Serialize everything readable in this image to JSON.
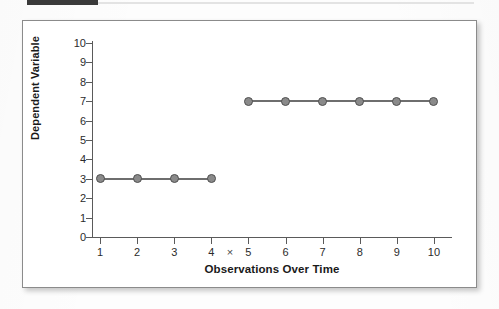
{
  "header": {
    "bar_color": "#3a3a3a",
    "rule_color": "#e3e3e3"
  },
  "figure": {
    "frame_color": "#8b8b8b",
    "background": "#ffffff"
  },
  "chart_data": {
    "type": "line",
    "title": "",
    "subtitle": "",
    "xlabel": "Observations Over Time",
    "ylabel": "Dependent Variable",
    "x": [
      1,
      2,
      3,
      4,
      5,
      6,
      7,
      8,
      9,
      10
    ],
    "xtick_labels": [
      "1",
      "2",
      "3",
      "4",
      "5",
      "6",
      "7",
      "8",
      "9",
      "10"
    ],
    "ytick_labels": [
      "0",
      "1",
      "2",
      "3",
      "4",
      "5",
      "6",
      "7",
      "8",
      "9",
      "10"
    ],
    "xlim": [
      0.6,
      10.4
    ],
    "ylim": [
      0,
      10
    ],
    "grid": false,
    "legend": null,
    "marker_color": "#8a8a8a",
    "marker_edge_color": "#4f4f4f",
    "line_color": "#6e6e6e",
    "annotations": [
      {
        "name": "intervention-marker",
        "symbol": "×",
        "x": 4.5,
        "note": "phase change between observation 4 and 5"
      }
    ],
    "series": [
      {
        "name": "Baseline phase",
        "x": [
          1,
          2,
          3,
          4
        ],
        "values": [
          3,
          3,
          3,
          3
        ]
      },
      {
        "name": "Treatment phase",
        "x": [
          5,
          6,
          7,
          8,
          9,
          10
        ],
        "values": [
          7,
          7,
          7,
          7,
          7,
          7
        ]
      }
    ]
  }
}
